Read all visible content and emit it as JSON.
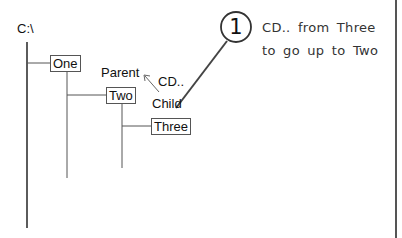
{
  "tree": {
    "root": "C:\\",
    "nodes": [
      "One",
      "Two",
      "Three"
    ]
  },
  "labels": {
    "parent": "Parent",
    "child": "Child",
    "command": "CD.."
  },
  "callout": {
    "number": "1",
    "line1": "CD.. from Three",
    "line2": "to go up to Two"
  }
}
